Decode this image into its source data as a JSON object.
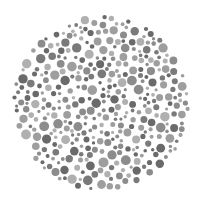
{
  "image": {
    "subject": "color-vision-test-plate",
    "description": "Circular plate filled with gray dots of varying size and shade",
    "palette": [
      "#7a7a7a",
      "#8c8c8c",
      "#9e9e9e",
      "#b0b0b0",
      "#6a6a6a"
    ],
    "background": "#ffffff"
  }
}
